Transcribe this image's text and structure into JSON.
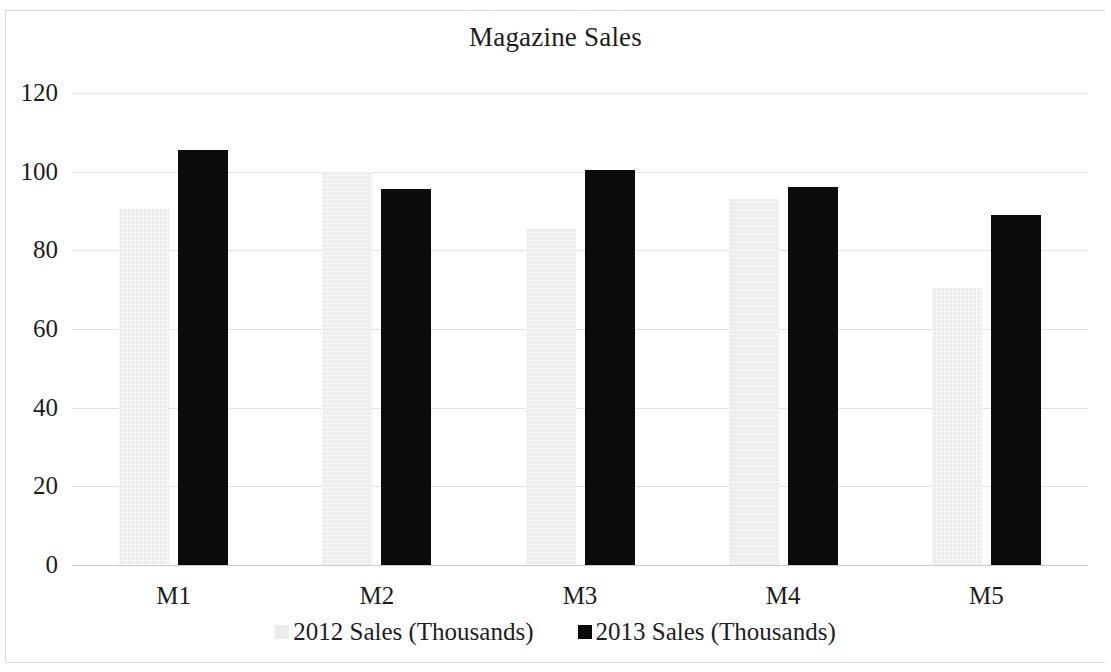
{
  "chart_data": {
    "type": "bar",
    "title": "Magazine Sales",
    "xlabel": "",
    "ylabel": "",
    "categories": [
      "M1",
      "M2",
      "M3",
      "M4",
      "M5"
    ],
    "series": [
      {
        "name": "2012 Sales (Thousands)",
        "color": "#ebebeb",
        "values": [
          90.5,
          100,
          85.5,
          93,
          70.5
        ]
      },
      {
        "name": "2013 Sales (Thousands)",
        "color": "#0b0b0b",
        "values": [
          105.5,
          95.5,
          100.5,
          96,
          89
        ]
      }
    ],
    "ylim": [
      0,
      120
    ],
    "yticks": [
      0,
      20,
      40,
      60,
      80,
      100,
      120
    ],
    "ytick_labels": [
      "0",
      "20",
      "40",
      "60",
      "80",
      "100",
      "120"
    ],
    "grid": true,
    "grid_color": "#e2e2e2",
    "legend_position": "bottom",
    "background": "#ffffff"
  }
}
